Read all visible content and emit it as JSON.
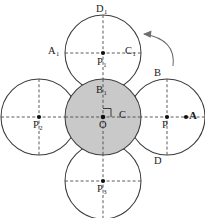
{
  "figure": {
    "background_color": "#ffffff",
    "stroke_color": "#3c3c3c",
    "shaded_fill_color": "#c9c9c9",
    "label_color": "#1a1a1a",
    "arrow_color": "#6e6e6e"
  },
  "circles": [
    {
      "id": "center",
      "center_label": "O",
      "cx": 103,
      "cy": 117,
      "r": 38,
      "shaded": true
    },
    {
      "id": "top",
      "center_label": "P",
      "center_sub": "1",
      "cx": 103,
      "cy": 53,
      "r": 38,
      "shaded": false
    },
    {
      "id": "right",
      "center_label": "P",
      "center_sub": "",
      "cx": 167,
      "cy": 117,
      "r": 38,
      "shaded": false
    },
    {
      "id": "left",
      "center_label": "P",
      "center_sub": "2",
      "cx": 39,
      "cy": 117,
      "r": 38,
      "shaded": false
    },
    {
      "id": "bottom",
      "center_label": "P",
      "center_sub": "3",
      "cx": 103,
      "cy": 181,
      "r": 38,
      "shaded": false
    }
  ],
  "labels": {
    "top_circle_top": {
      "text": "D",
      "sub": "1"
    },
    "top_circle_left": {
      "text": "A",
      "sub": "1"
    },
    "top_circle_right": {
      "text": "C",
      "sub": "1"
    },
    "top_circle_center": {
      "text": "P",
      "sub": "1"
    },
    "center_circle_top": {
      "text": "B",
      "sub": "1"
    },
    "center_circle_center": {
      "text": "O",
      "sub": ""
    },
    "center_circle_right": {
      "text": "C",
      "sub": ""
    },
    "right_circle_top": {
      "text": "B",
      "sub": ""
    },
    "right_circle_bottom": {
      "text": "D",
      "sub": ""
    },
    "right_circle_center": {
      "text": "P",
      "sub": ""
    },
    "right_circle_edge": {
      "text": "A",
      "sub": ""
    },
    "left_circle_center": {
      "text": "P",
      "sub": "2"
    },
    "bottom_circle_center": {
      "text": "P",
      "sub": "3"
    }
  },
  "annotations": {
    "rotation_arrow": {
      "name": "counterclockwise-rotation-arrow",
      "direction": "counterclockwise"
    },
    "right_angle_marker": {
      "name": "right-angle-marker",
      "at": "O"
    }
  }
}
